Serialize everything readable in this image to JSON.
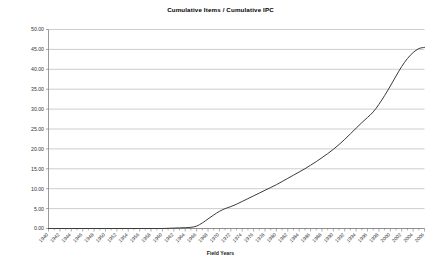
{
  "chart_data": {
    "type": "line",
    "title": "Cumulative Items / Cumulative IPC",
    "xlabel": "Field Years",
    "ylabel": "",
    "ylim": [
      0,
      50
    ],
    "ytick_step": 5,
    "ytick_labels": [
      "0.00",
      "5.00",
      "10.00",
      "15.00",
      "20.00",
      "25.00",
      "30.00",
      "35.00",
      "40.00",
      "45.00",
      "50.00"
    ],
    "ytick_values": [
      0,
      5,
      10,
      15,
      20,
      25,
      30,
      35,
      40,
      45,
      50
    ],
    "grid": "horizontal",
    "legend": "none",
    "xtick_rotation": 45,
    "xtick_label_interval": 2,
    "x": [
      1940,
      1941,
      1942,
      1943,
      1944,
      1945,
      1946,
      1947,
      1948,
      1949,
      1950,
      1951,
      1952,
      1953,
      1954,
      1955,
      1956,
      1957,
      1958,
      1959,
      1960,
      1961,
      1962,
      1963,
      1964,
      1965,
      1966,
      1967,
      1968,
      1969,
      1970,
      1971,
      1972,
      1973,
      1974,
      1975,
      1976,
      1977,
      1978,
      1979,
      1980,
      1981,
      1982,
      1983,
      1984,
      1985,
      1986,
      1987,
      1988,
      1989,
      1990,
      1991,
      1992,
      1993,
      1994,
      1995,
      1996,
      1997,
      1998,
      1999,
      2000,
      2001,
      2002,
      2003,
      2004,
      2005,
      2006
    ],
    "xtick_labels": [
      "1940",
      "1942",
      "1944",
      "1946",
      "1948",
      "1950",
      "1952",
      "1954",
      "1956",
      "1958",
      "1960",
      "1962",
      "1964",
      "1966",
      "1968",
      "1970",
      "1972",
      "1974",
      "1976",
      "1978",
      "1980",
      "1982",
      "1984",
      "1986",
      "1988",
      "1990",
      "1992",
      "1994",
      "1996",
      "1998",
      "2000",
      "2002",
      "2004",
      "2006"
    ],
    "series": [
      {
        "name": "Cumulative Items / Cumulative IPC",
        "color": "#3a3a3a",
        "values": [
          0.0,
          0.0,
          0.0,
          0.0,
          0.0,
          0.0,
          0.0,
          0.0,
          0.0,
          0.0,
          0.0,
          0.0,
          0.0,
          0.0,
          0.0,
          0.0,
          0.0,
          0.0,
          0.0,
          0.0,
          0.0,
          0.05,
          0.1,
          0.15,
          0.2,
          0.3,
          0.6,
          1.4,
          2.4,
          3.4,
          4.3,
          5.0,
          5.5,
          6.1,
          6.8,
          7.5,
          8.2,
          8.9,
          9.6,
          10.3,
          11.0,
          11.8,
          12.6,
          13.4,
          14.2,
          15.0,
          15.9,
          16.8,
          17.8,
          18.8,
          19.9,
          21.1,
          22.4,
          23.8,
          25.2,
          26.6,
          27.9,
          29.3,
          31.2,
          33.4,
          35.8,
          38.3,
          40.7,
          42.7,
          44.2,
          45.2,
          45.5
        ]
      }
    ]
  },
  "axis": {
    "x_title": "Field Years"
  },
  "style": {
    "grid_color": "#b8b8b8",
    "axis_color": "#808080",
    "line_color": "#3a3a3a",
    "background": "#ffffff"
  }
}
